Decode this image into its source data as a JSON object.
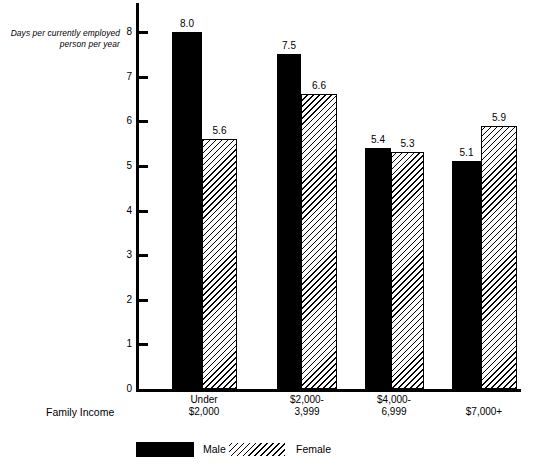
{
  "chart_data": {
    "type": "bar",
    "title": "",
    "ylabel": "Days per currently employed person per year",
    "ylabel_line1": "Days per currently employed",
    "ylabel_line2": "person per year",
    "xlabel": "Family Income",
    "categories": [
      "Under\n$2,000",
      "$2,000-\n3,999",
      "$4,000-\n6,999",
      "$7,000+"
    ],
    "ylim": [
      0,
      8
    ],
    "yticks": [
      0,
      1,
      2,
      3,
      4,
      5,
      6,
      7,
      8
    ],
    "ytick_labels": [
      "0",
      "1",
      "2",
      "3",
      "4",
      "5",
      "6",
      "7",
      "8"
    ],
    "grid": false,
    "legend_position": "bottom-left",
    "series": [
      {
        "name": "Male",
        "color": "#000000",
        "fill": "solid-black",
        "values": [
          8.0,
          7.5,
          5.4,
          5.1
        ],
        "value_labels": [
          "8.0",
          "7.5",
          "5.4",
          "5.1"
        ]
      },
      {
        "name": "Female",
        "color": "#000000",
        "fill": "diagonal-hatch",
        "values": [
          5.6,
          6.6,
          5.3,
          5.9
        ],
        "value_labels": [
          "5.6",
          "6.6",
          "5.3",
          "5.9"
        ]
      }
    ]
  },
  "legend": {
    "items": [
      {
        "label": "Male"
      },
      {
        "label": "Female"
      }
    ]
  }
}
